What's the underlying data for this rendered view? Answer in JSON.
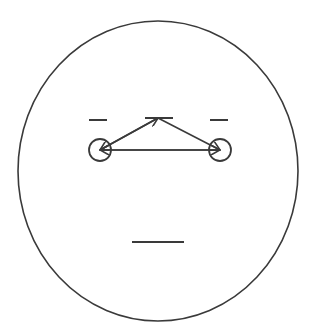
{
  "colors": {
    "stroke": "#3a3a3a",
    "background": "#ffffff"
  },
  "diagram": {
    "face_outline": {
      "shape": "ellipse",
      "cx": 158,
      "cy": 171,
      "rx": 140,
      "ry": 150
    },
    "left_eyebrow": {
      "x1": 89,
      "y1": 120,
      "x2": 107,
      "y2": 120
    },
    "right_eyebrow": {
      "x1": 210,
      "y1": 120,
      "x2": 228,
      "y2": 120
    },
    "top_mark": {
      "x1": 145,
      "y1": 118,
      "x2": 173,
      "y2": 118
    },
    "left_eye": {
      "cx": 100,
      "cy": 150,
      "r": 11
    },
    "right_eye": {
      "cx": 220,
      "cy": 150,
      "r": 11
    },
    "mouth": {
      "x1": 132,
      "y1": 242,
      "x2": 184,
      "y2": 242
    },
    "arrows": [
      {
        "from": [
          158,
          118
        ],
        "to": [
          100,
          150
        ]
      },
      {
        "from": [
          100,
          150
        ],
        "to": [
          158,
          118
        ]
      },
      {
        "from": [
          158,
          118
        ],
        "to": [
          220,
          150
        ]
      },
      {
        "from": [
          100,
          150
        ],
        "to": [
          220,
          150
        ]
      },
      {
        "from": [
          220,
          150
        ],
        "to": [
          100,
          150
        ]
      }
    ]
  }
}
